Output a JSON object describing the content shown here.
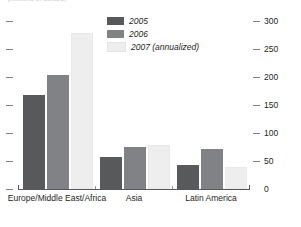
{
  "subtitle": "(millions of dollars)",
  "legend": {
    "position": "top-center",
    "items": [
      {
        "label": "2005",
        "color": "#58595b"
      },
      {
        "label": "2006",
        "color": "#808285"
      },
      {
        "label": "2007 (annualized)",
        "color": "#eeeeee"
      }
    ]
  },
  "axis": {
    "y_right_ticks": [
      "300",
      "250",
      "200",
      "150",
      "100",
      "50",
      "0"
    ],
    "y_left_ticks": [
      "",
      "",
      "",
      "",
      "",
      "",
      ""
    ]
  },
  "chart_data": {
    "type": "bar",
    "title": "",
    "subtitle": "(millions of dollars)",
    "xlabel": "",
    "ylabel": "",
    "ylim": [
      0,
      300
    ],
    "grid": false,
    "legend_position": "top-center",
    "categories": [
      "Europe/Middle East/Africa",
      "Asia",
      "Latin America"
    ],
    "series": [
      {
        "name": "2005",
        "color": "#58595b",
        "values": [
          167,
          57,
          42
        ]
      },
      {
        "name": "2006",
        "color": "#808285",
        "values": [
          203,
          75,
          72
        ]
      },
      {
        "name": "2007 (annualized)",
        "color": "#eeeeee",
        "values": [
          279,
          78,
          39
        ]
      }
    ],
    "yticks": [
      0,
      50,
      100,
      150,
      200,
      250,
      300
    ],
    "ytick_labels": [
      "0",
      "50",
      "100",
      "150",
      "200",
      "250",
      "300"
    ]
  }
}
